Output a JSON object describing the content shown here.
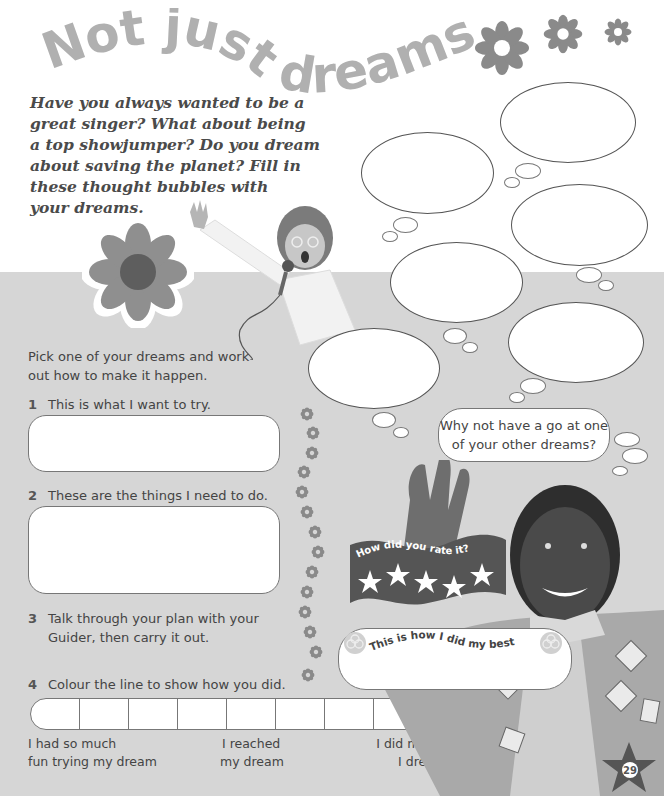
{
  "page": {
    "title": "Not just dreams...",
    "title_color": "#a8a8a8",
    "background_band_color": "#d6d6d6",
    "page_number": "29"
  },
  "intro": {
    "lines": [
      "Have you always wanted to be a",
      "great singer? What about being",
      "a top showjumper? Do you dream",
      "about saving the planet? Fill in",
      "these thought bubbles with",
      "your dreams."
    ]
  },
  "thought_bubbles": {
    "count": 6,
    "items": [
      {
        "id": "bubble-1",
        "value": ""
      },
      {
        "id": "bubble-2",
        "value": ""
      },
      {
        "id": "bubble-3",
        "value": ""
      },
      {
        "id": "bubble-4",
        "value": ""
      },
      {
        "id": "bubble-5",
        "value": ""
      },
      {
        "id": "bubble-6",
        "value": ""
      }
    ]
  },
  "activity": {
    "instruction_line1": "Pick one of your dreams and work",
    "instruction_line2": "out how to make it happen.",
    "steps": [
      {
        "number": "1",
        "text": "This is what I want to try.",
        "answer": ""
      },
      {
        "number": "2",
        "text": "These are the things I need to do.",
        "answer": ""
      },
      {
        "number": "3",
        "text_line1": "Talk through your plan with your",
        "text_line2": "Guider, then carry it out."
      },
      {
        "number": "4",
        "text": "Colour the line to show how you did."
      }
    ],
    "scale": {
      "cells": 9,
      "label_left_line1": "I had so much",
      "label_left_line2": "fun trying my dream",
      "label_mid_line1": "I reached",
      "label_mid_line2": "my dream",
      "label_right_line1": "I did more than",
      "label_right_line2": "I dreamt of!"
    }
  },
  "callouts": {
    "why_not_line1": "Why not have a go at one",
    "why_not_line2": "of your other dreams?",
    "rating_banner": "How did you rate it?",
    "rating_stars": 5,
    "best_label": "This is how I did my best",
    "best_answer": ""
  },
  "icons": {
    "title_flowers": [
      "flower-icon",
      "flower-icon",
      "flower-icon"
    ],
    "column_flowers": 14,
    "trefoil": "trefoil-badge-icon",
    "star": "star-icon"
  }
}
